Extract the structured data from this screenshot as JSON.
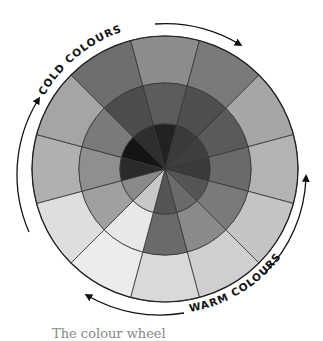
{
  "diagram": {
    "type": "colour-wheel",
    "center": [
      165,
      169
    ],
    "rings": [
      {
        "name": "inner",
        "r0": 0,
        "r1": 45
      },
      {
        "name": "middle",
        "r0": 45,
        "r1": 86
      },
      {
        "name": "outer",
        "r0": 86,
        "r1": 133
      }
    ],
    "sector_count": 12,
    "sector_angles_deg": [
      0,
      30,
      60,
      90,
      120,
      150,
      180,
      210,
      240,
      270,
      300,
      330
    ],
    "colors": {
      "inner": [
        "#222222",
        "#3a3a3a",
        "#3f3f3f",
        "#3a3a3a",
        "#555555",
        "#6a6a6a",
        "#555555",
        "#c8c8c8",
        "#8a8a8a",
        "#2a2a2a",
        "#141414",
        "#2e2e2e"
      ],
      "middle": [
        "#5c5c5c",
        "#4f4f4f",
        "#5a5a5a",
        "#6a6a6a",
        "#7a7a7a",
        "#8a8a8a",
        "#6a6a6a",
        "#e8e8e8",
        "#a0a0a0",
        "#8f8f8f",
        "#7a7a7a",
        "#4d4d4d"
      ],
      "outer": [
        "#8c8c8c",
        "#7a7a7a",
        "#a6a6a6",
        "#b3b3b3",
        "#c4c4c4",
        "#cfcfcf",
        "#d9d9d9",
        "#ececec",
        "#dedede",
        "#b0b0b0",
        "#a5a5a5",
        "#6e6e6e"
      ]
    },
    "line_color": "#333333",
    "labels": {
      "cold": "COLD COLOURS",
      "warm": "WARM COLOURS"
    },
    "caption": "The colour wheel"
  }
}
